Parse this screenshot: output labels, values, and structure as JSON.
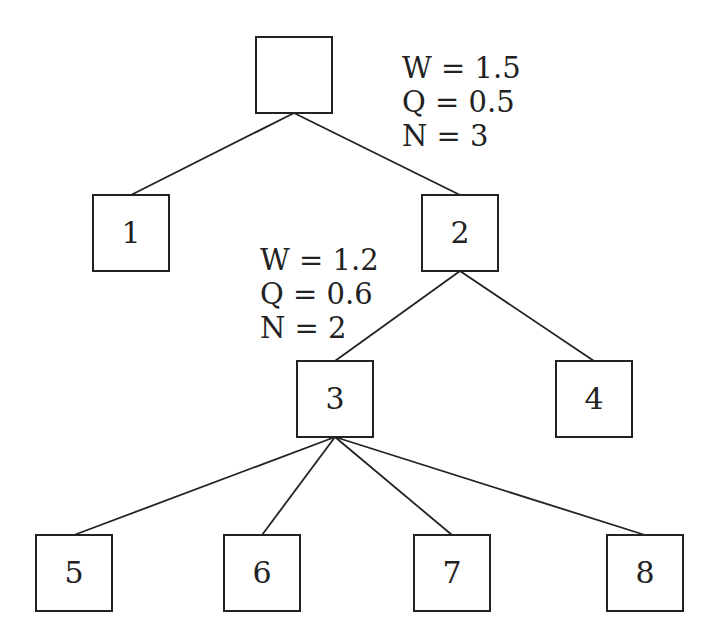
{
  "diagram": {
    "type": "tree",
    "box_size": 76,
    "stroke_color": "#222222",
    "nodes": [
      {
        "id": "root",
        "label": "",
        "x": 256,
        "y": 37
      },
      {
        "id": "n1",
        "label": "1",
        "x": 93,
        "y": 195
      },
      {
        "id": "n2",
        "label": "2",
        "x": 422,
        "y": 195
      },
      {
        "id": "n3",
        "label": "3",
        "x": 297,
        "y": 361
      },
      {
        "id": "n4",
        "label": "4",
        "x": 556,
        "y": 361
      },
      {
        "id": "n5",
        "label": "5",
        "x": 36,
        "y": 535
      },
      {
        "id": "n6",
        "label": "6",
        "x": 224,
        "y": 535
      },
      {
        "id": "n7",
        "label": "7",
        "x": 414,
        "y": 535
      },
      {
        "id": "n8",
        "label": "8",
        "x": 607,
        "y": 535
      }
    ],
    "edges": [
      {
        "from": "root",
        "to": "n1"
      },
      {
        "from": "root",
        "to": "n2"
      },
      {
        "from": "n2",
        "to": "n3"
      },
      {
        "from": "n2",
        "to": "n4"
      },
      {
        "from": "n3",
        "to": "n5"
      },
      {
        "from": "n3",
        "to": "n6"
      },
      {
        "from": "n3",
        "to": "n7"
      },
      {
        "from": "n3",
        "to": "n8"
      }
    ],
    "annotations": [
      {
        "attached_to": "root",
        "x": 402,
        "y": 78,
        "lines": [
          "W = 1.5",
          "Q = 0.5",
          "N = 3"
        ]
      },
      {
        "attached_to": "n2",
        "x": 260,
        "y": 270,
        "lines": [
          "W = 1.2",
          "Q = 0.6",
          "N = 2"
        ]
      }
    ]
  }
}
